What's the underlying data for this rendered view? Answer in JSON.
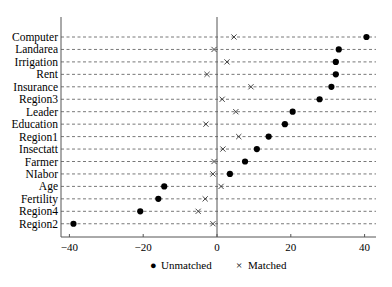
{
  "chart_data": {
    "type": "scatter",
    "subtype": "dot-plot",
    "title": "",
    "xlabel": "",
    "ylabel": "",
    "xlim": [
      -43,
      44
    ],
    "xticks": [
      -40,
      -20,
      0,
      20,
      40
    ],
    "xtick_labels": [
      "−40",
      "−20",
      "0",
      "20",
      "40"
    ],
    "grid": "horizontal dashed lines per category",
    "reference_line_x": 0,
    "categories": [
      "Computer",
      "Landarea",
      "Irrigation",
      "Rent",
      "Insurance",
      "Region3",
      "Leader",
      "Education",
      "Region1",
      "Insectatt",
      "Farmer",
      "NIabor",
      "Age",
      "Fertility",
      "Region4",
      "Region2"
    ],
    "series": [
      {
        "name": "Unmatched",
        "marker": "filled-circle",
        "values": [
          40.5,
          33.0,
          32.2,
          32.2,
          31.0,
          27.8,
          20.5,
          18.4,
          14.0,
          10.8,
          7.6,
          3.5,
          -14.3,
          -15.9,
          -20.8,
          -38.9
        ]
      },
      {
        "name": "Matched",
        "marker": "x",
        "values": [
          4.6,
          -0.8,
          2.7,
          -2.7,
          9.2,
          1.4,
          5.1,
          -3.0,
          5.9,
          1.6,
          -0.8,
          -1.1,
          1.1,
          -3.2,
          -5.1,
          -1.1
        ]
      }
    ],
    "legend": {
      "position": "bottom",
      "entries": [
        "Unmatched",
        "Matched"
      ]
    }
  },
  "legend": {
    "unmatched_symbol": "●",
    "unmatched_label": "Unmatched",
    "matched_symbol": "×",
    "matched_label": "Matched"
  },
  "colors": {
    "marker": "#000000",
    "grid": "#555555",
    "axis": "#555555"
  }
}
